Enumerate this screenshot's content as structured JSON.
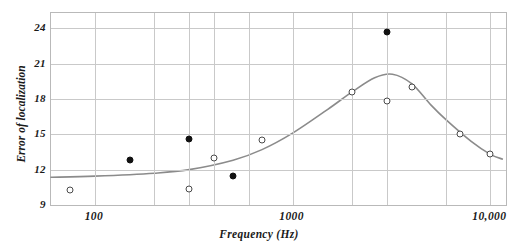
{
  "chart_data": {
    "type": "scatter",
    "title": "",
    "xlabel": "Frequency (Hz)",
    "ylabel": "Error of localization",
    "xscale": "log",
    "xlim": [
      60,
      12000
    ],
    "ylim": [
      9,
      25.3
    ],
    "grid": true,
    "legend": "none",
    "ytick_labels": [
      "24",
      "21",
      "18",
      "15",
      "12",
      "9"
    ],
    "ytick_values": [
      24,
      21,
      18,
      15,
      12,
      9
    ],
    "xtick_labels": [
      "100",
      "1000",
      "10,000"
    ],
    "xtick_values": [
      100,
      1000,
      10000
    ],
    "x_gridlines": [
      100,
      200,
      300,
      400,
      600,
      1000,
      2000,
      3000,
      6000,
      10000
    ],
    "series": [
      {
        "name": "filled-circles",
        "marker": "filled-circle",
        "color": "#111111",
        "points": [
          {
            "x": 150,
            "y": 12.8
          },
          {
            "x": 300,
            "y": 14.6
          },
          {
            "x": 500,
            "y": 11.5
          },
          {
            "x": 3000,
            "y": 23.7
          }
        ]
      },
      {
        "name": "open-circles",
        "marker": "open-circle",
        "color": "#4a4a4a",
        "points": [
          {
            "x": 75,
            "y": 10.3
          },
          {
            "x": 300,
            "y": 10.4
          },
          {
            "x": 400,
            "y": 13.0
          },
          {
            "x": 700,
            "y": 14.5
          },
          {
            "x": 2000,
            "y": 18.6
          },
          {
            "x": 3000,
            "y": 17.8
          },
          {
            "x": 4000,
            "y": 19.0
          },
          {
            "x": 7000,
            "y": 15.0
          },
          {
            "x": 10000,
            "y": 13.3
          }
        ]
      },
      {
        "name": "fitted-curve",
        "marker": "none",
        "line": "solid",
        "color": "#8b8b8b",
        "points": [
          {
            "x": 60,
            "y": 11.35
          },
          {
            "x": 100,
            "y": 11.45
          },
          {
            "x": 200,
            "y": 11.7
          },
          {
            "x": 300,
            "y": 12.0
          },
          {
            "x": 500,
            "y": 12.8
          },
          {
            "x": 700,
            "y": 13.7
          },
          {
            "x": 1000,
            "y": 15.1
          },
          {
            "x": 1500,
            "y": 17.1
          },
          {
            "x": 2000,
            "y": 18.6
          },
          {
            "x": 2600,
            "y": 19.8
          },
          {
            "x": 3200,
            "y": 20.1
          },
          {
            "x": 4000,
            "y": 19.3
          },
          {
            "x": 5000,
            "y": 17.5
          },
          {
            "x": 6000,
            "y": 16.2
          },
          {
            "x": 8000,
            "y": 14.4
          },
          {
            "x": 10000,
            "y": 13.3
          },
          {
            "x": 11500,
            "y": 12.9
          }
        ]
      }
    ]
  },
  "colors": {
    "grid": "#c9c9c9",
    "frame": "#b9b9b9",
    "curve": "#8b8b8b",
    "filled_marker": "#111111",
    "open_marker": "#4a4a4a",
    "text": "#1a1a1a",
    "background": "#ffffff"
  }
}
